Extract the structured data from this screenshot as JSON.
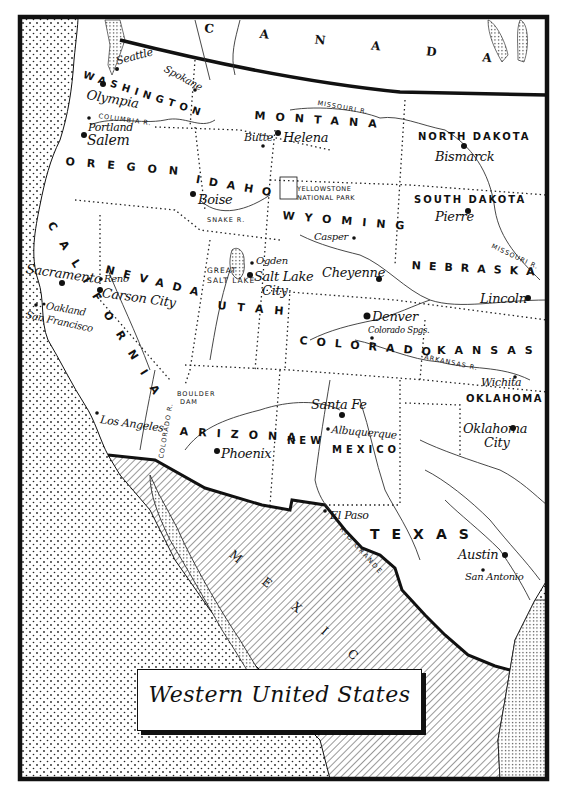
{
  "map": {
    "title": "Western United States",
    "countries": [
      {
        "name": "CANADA",
        "letters": [
          "C",
          "A",
          "N",
          "A",
          "D",
          "A"
        ]
      },
      {
        "name": "MEXICO",
        "letters": [
          "M",
          "E",
          "X",
          "I",
          "C",
          "O"
        ]
      }
    ],
    "states": {
      "washington": "WASHINGTON",
      "oregon": "OREGON",
      "california": "CALIFORNIA",
      "nevada": "NEVADA",
      "idaho": "IDAHO",
      "montana": "MONTANA",
      "wyoming": "WYOMING",
      "utah": "UTAH",
      "arizona": "ARIZONA",
      "colorado": "COLORADO",
      "new_mexico_1": "NEW",
      "new_mexico_2": "MEXICO",
      "north_dakota": "NORTH DAKOTA",
      "south_dakota": "SOUTH DAKOTA",
      "nebraska": "NEBRASKA",
      "kansas": "KANSAS",
      "oklahoma": "OKLAHOMA",
      "texas": "TEXAS"
    },
    "cities": {
      "seattle": "Seattle",
      "spokane": "Spokane",
      "olympia": "Olympia",
      "portland": "Portland",
      "salem": "Salem",
      "butte": "Butte",
      "helena": "Helena",
      "bismarck": "Bismarck",
      "boise": "Boise",
      "pierre": "Pierre",
      "casper": "Casper",
      "cheyenne": "Cheyenne",
      "sacramento": "Sacramento",
      "reno": "Reno",
      "carson_city": "Carson City",
      "oakland": "Oakland",
      "san_francisco": "San Francisco",
      "ogden": "Ogden",
      "salt_lake_city_1": "Salt Lake",
      "salt_lake_city_2": "City",
      "lincoln": "Lincoln",
      "denver": "Denver",
      "colorado_springs": "Colorado Spgs.",
      "wichita": "Wichita",
      "los_angeles": "Los Angeles",
      "phoenix": "Phoenix",
      "santa_fe": "Santa Fe",
      "albuquerque": "Albuquerque",
      "oklahoma_city_1": "Oklahoma",
      "oklahoma_city_2": "City",
      "el_paso": "El Paso",
      "austin": "Austin",
      "san_antonio": "San Antonio"
    },
    "features": {
      "columbia_river": "COLUMBIA R.",
      "missouri_river_north": "MISSOURI R.",
      "missouri_river_south": "MISSOURI R.",
      "snake_river": "SNAKE R.",
      "yellowstone_1": "YELLOWSTONE",
      "yellowstone_2": "NATIONAL PARK",
      "great_salt_lake_1": "GREAT",
      "great_salt_lake_2": "SALT LAKE",
      "boulder_dam_1": "BOULDER",
      "boulder_dam_2": "DAM",
      "colorado_river": "COLORADO R.",
      "arkansas_river": "ARKANSAS R.",
      "rio_grande": "RIO GRANDE"
    },
    "colors": {
      "ink": "#111111",
      "paper": "#ffffff"
    }
  }
}
